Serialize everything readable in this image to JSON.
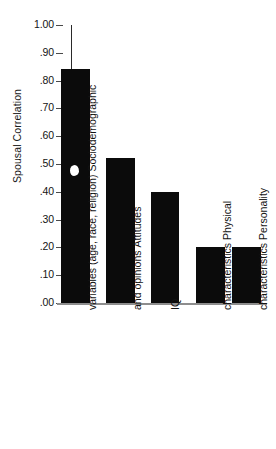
{
  "chart_data": {
    "type": "bar",
    "title": "",
    "subtitle": "",
    "xlabel": "",
    "ylabel": "Spousal Correlation",
    "ylim": [
      0.0,
      1.0
    ],
    "ytick_labels": [
      "1.00",
      ".90",
      ".80",
      ".70",
      ".60",
      ".50",
      ".40",
      ".30",
      ".20",
      ".10",
      ".00"
    ],
    "ytick_values": [
      1.0,
      0.9,
      0.8,
      0.7,
      0.6,
      0.5,
      0.4,
      0.3,
      0.2,
      0.1,
      0.0
    ],
    "grid": false,
    "legend": false,
    "bar_color": "#0b0b0b",
    "categories": [
      "Sociodemographic variables (age, race, religion)",
      "Attitudes and opinions",
      "IQ",
      "Physical characteristics",
      "Personality characteristics"
    ],
    "category_lines": [
      [
        "Sociodemographic",
        "variables (age, race, religion)"
      ],
      [
        "Attitudes",
        "and opinions"
      ],
      [
        "IQ"
      ],
      [
        "Physical",
        "characteristics"
      ],
      [
        "Personality",
        "characteristics"
      ]
    ],
    "values": [
      0.84,
      0.52,
      0.4,
      0.2,
      0.2
    ],
    "annotations": [
      {
        "name": "white-speck-artifact",
        "description": "small white scan artifact on first bar",
        "x_category": "Sociodemographic variables (age, race, religion)",
        "y_value": 0.48
      }
    ]
  },
  "axis": {
    "y_title": "Spousal Correlation"
  }
}
